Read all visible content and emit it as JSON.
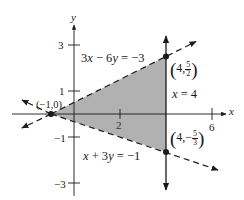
{
  "figure": {
    "axes": {
      "x_label": "x",
      "y_label": "y",
      "x_ticks": [
        {
          "value": 2,
          "label": "2"
        },
        {
          "value": 6,
          "label": "6"
        }
      ],
      "y_ticks": [
        {
          "value": 3,
          "label": "3"
        },
        {
          "value": 1,
          "label": "1"
        },
        {
          "value": -1,
          "label": "−1"
        },
        {
          "value": -3,
          "label": "−3"
        }
      ]
    },
    "lines": [
      {
        "equation": "3x − 6y = −3",
        "lhs_a": "3",
        "lhs_var1": "x",
        "op": " − 6",
        "lhs_var2": "y",
        "rhs": " = −3",
        "style": "dashed"
      },
      {
        "equation": "x + 3y = −1",
        "lhs_var1": "x",
        "op": " + 3",
        "lhs_var2": "y",
        "rhs": " = −1",
        "style": "dashed"
      },
      {
        "equation": "x = 4",
        "lhs_var1": "x",
        "rhs": " = 4",
        "style": "solid"
      }
    ],
    "points": [
      {
        "label": "(−1,0)",
        "x": -1,
        "y": 0
      },
      {
        "label": "(4, 5/2)",
        "x_text": "4,",
        "num": "5",
        "den": "2",
        "sign": "",
        "x": 4,
        "y": 2.5
      },
      {
        "label": "(4, −5/3)",
        "x_text": "4,",
        "num": "5",
        "den": "3",
        "sign": "−",
        "x": 4,
        "y": -1.6667
      }
    ],
    "shaded_region": {
      "vertices": [
        [
          -1,
          0
        ],
        [
          4,
          2.5
        ],
        [
          4,
          -1.6667
        ]
      ],
      "fill": "#a9a9a9"
    },
    "colors": {
      "ink": "#1a1a1a",
      "shade": "#a9a9a9",
      "background": "#ffffff"
    }
  }
}
